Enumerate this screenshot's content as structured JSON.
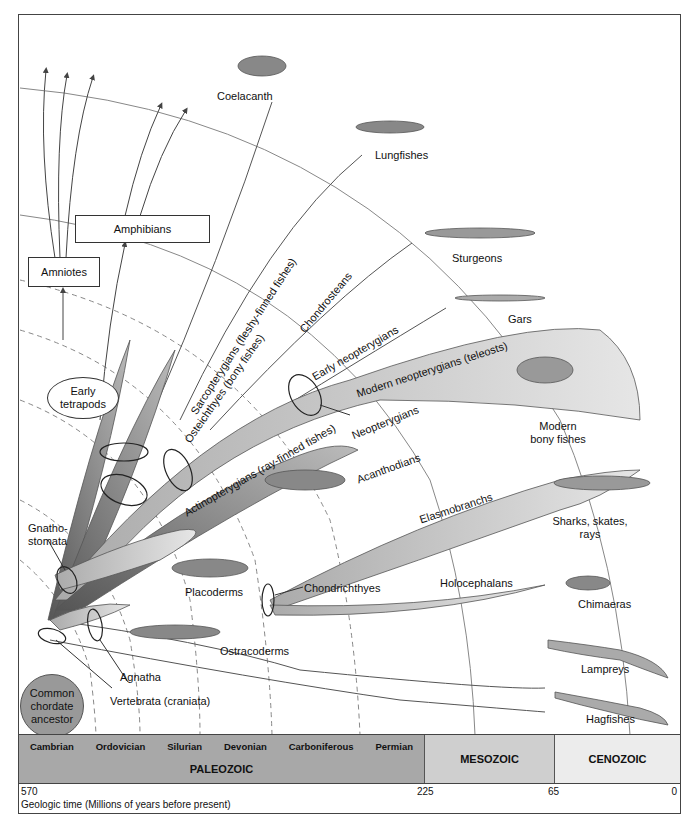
{
  "diagram": {
    "type": "phylogenetic_tree",
    "root": {
      "label": "Common chordate ancestor",
      "fill": "#999999"
    },
    "clade_labels": {
      "vertebrata": "Vertebrata (craniata)",
      "agnatha": "Agnatha",
      "gnathostomata": "Gnatho-\nstomata",
      "gnathostomata_line1": "Gnatho-",
      "gnathostomata_line2": "stomata",
      "chondrichthyes": "Chondrichthyes",
      "osteichthyes": "Osteichthyes (bony fishes)",
      "sarcopterygians": "Sarcopterygians (fleshy-finned fishes)",
      "actinopterygians": "Actinopterygians (ray-finned fishes)",
      "neopterygians": "Neopterygians",
      "chondrosteans": "Chondrosteans",
      "early_neopterygians": "Early neopterygians",
      "modern_neopterygians": "Modern neopterygians (teleosts)",
      "elasmobranchs": "Elasmobranchs",
      "holocephalans": "Holocephalans",
      "acanthodians": "Acanthodians",
      "placoderms": "Placoderms",
      "ostracoderms": "Ostracoderms"
    },
    "boxes": {
      "amphibians": "Amphibians",
      "amniotes": "Amniotes",
      "early_tetrapods_line1": "Early",
      "early_tetrapods_line2": "tetrapods"
    },
    "terminal_taxa": [
      {
        "id": "coelacanth",
        "label": "Coelacanth"
      },
      {
        "id": "lungfishes",
        "label": "Lungfishes"
      },
      {
        "id": "sturgeons",
        "label": "Sturgeons"
      },
      {
        "id": "gars",
        "label": "Gars"
      },
      {
        "id": "modern_bony_fishes",
        "label_line1": "Modern",
        "label_line2": "bony fishes"
      },
      {
        "id": "sharks",
        "label_line1": "Sharks, skates,",
        "label_line2": "rays"
      },
      {
        "id": "chimaeras",
        "label": "Chimaeras"
      },
      {
        "id": "lampreys",
        "label": "Lampreys"
      },
      {
        "id": "hagfishes",
        "label": "Hagfishes"
      }
    ]
  },
  "timescale": {
    "eras": [
      {
        "name": "PALEOZOIC",
        "periods": [
          "Cambrian",
          "Ordovician",
          "Silurian",
          "Devonian",
          "Carboniferous",
          "Permian"
        ],
        "fill": "#a8a8a8"
      },
      {
        "name": "MESOZOIC",
        "periods": [],
        "fill": "#cfcfcf"
      },
      {
        "name": "CENOZOIC",
        "periods": [],
        "fill": "#ececec"
      }
    ],
    "ticks": [
      "570",
      "225",
      "65",
      "0"
    ],
    "axis_title": "Geologic time (Millions of years before present)"
  },
  "colors": {
    "branch_dark": "#6e6e6e",
    "branch_mid": "#9a9a9a",
    "branch_light": "#cfcfcf",
    "line": "#444444",
    "grid_dash": "#999999"
  }
}
